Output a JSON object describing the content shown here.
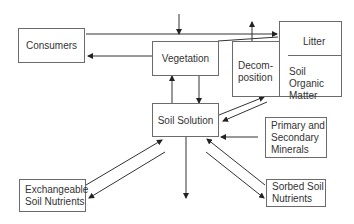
{
  "diagram": {
    "nodes": {
      "consumers": "Consumers",
      "vegetation": "Vegetation",
      "litter": "Litter",
      "decomposition_line1": "Decom-",
      "decomposition_line2": "position",
      "soil_organic_matter_line1": "Soil Organic",
      "soil_organic_matter_line2": "Matter",
      "soil_solution": "Soil Solution",
      "primary_secondary_minerals_line1": "Primary and",
      "primary_secondary_minerals_line2": "Secondary",
      "primary_secondary_minerals_line3": "Minerals",
      "exchangeable_soil_nutrients_line1": "Exchangeable",
      "exchangeable_soil_nutrients_line2": "Soil Nutrients",
      "sorbed_soil_nutrients_line1": "Sorbed Soil",
      "sorbed_soil_nutrients_line2": "Nutrients"
    },
    "colors": {
      "line": "#333333",
      "border": "#6b6b6b"
    }
  }
}
